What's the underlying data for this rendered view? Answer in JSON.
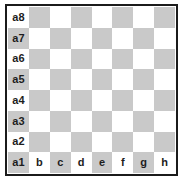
{
  "figure": {
    "name": "chessboard-coordinates-diagram",
    "board_size": 8,
    "colors": {
      "light_square": "#ffffff",
      "dark_square": "#c9c9c9",
      "border": "#1b1b1b",
      "label_text": "#1d1d1d",
      "background": "#ffffff"
    }
  },
  "labels": {
    "ranks": [
      "a8",
      "a7",
      "a6",
      "a5",
      "a4",
      "a3",
      "a2",
      "a1"
    ],
    "files": [
      "b",
      "c",
      "d",
      "e",
      "f",
      "g",
      "h"
    ]
  },
  "chart_data": {
    "type": "heatmap",
    "title": "",
    "xlabel": "",
    "ylabel": "",
    "categories": [
      "a",
      "b",
      "c",
      "d",
      "e",
      "f",
      "g",
      "h"
    ],
    "rows": [
      "8",
      "7",
      "6",
      "5",
      "4",
      "3",
      "2",
      "1"
    ],
    "legend": [],
    "grid": true,
    "values": [
      [
        0,
        1,
        0,
        1,
        0,
        1,
        0,
        1
      ],
      [
        1,
        0,
        1,
        0,
        1,
        0,
        1,
        0
      ],
      [
        0,
        1,
        0,
        1,
        0,
        1,
        0,
        1
      ],
      [
        1,
        0,
        1,
        0,
        1,
        0,
        1,
        0
      ],
      [
        0,
        1,
        0,
        1,
        0,
        1,
        0,
        1
      ],
      [
        1,
        0,
        1,
        0,
        1,
        0,
        1,
        0
      ],
      [
        0,
        1,
        0,
        1,
        0,
        1,
        0,
        1
      ],
      [
        1,
        0,
        1,
        0,
        1,
        0,
        1,
        0
      ]
    ],
    "cell_labels": [
      [
        "a8",
        "",
        "",
        "",
        "",
        "",
        "",
        ""
      ],
      [
        "a7",
        "",
        "",
        "",
        "",
        "",
        "",
        ""
      ],
      [
        "a6",
        "",
        "",
        "",
        "",
        "",
        "",
        ""
      ],
      [
        "a5",
        "",
        "",
        "",
        "",
        "",
        "",
        ""
      ],
      [
        "a4",
        "",
        "",
        "",
        "",
        "",
        "",
        ""
      ],
      [
        "a3",
        "",
        "",
        "",
        "",
        "",
        "",
        ""
      ],
      [
        "a2",
        "",
        "",
        "",
        "",
        "",
        "",
        ""
      ],
      [
        "a1",
        "b",
        "c",
        "d",
        "e",
        "f",
        "g",
        "h"
      ]
    ]
  }
}
